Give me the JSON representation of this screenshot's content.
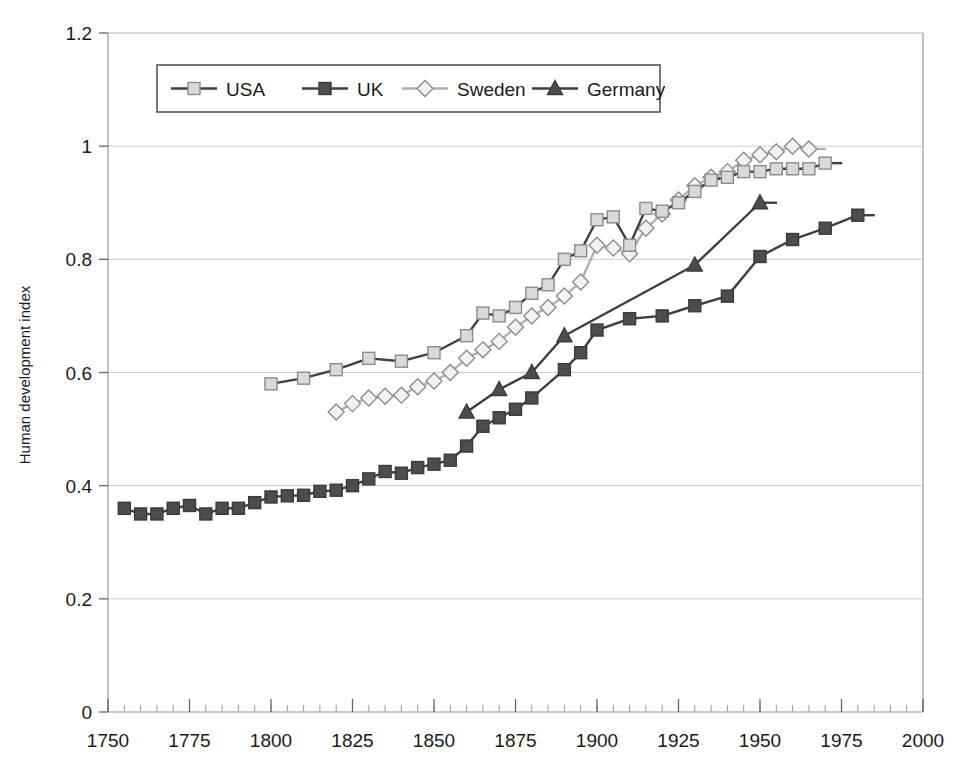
{
  "chart_data": {
    "type": "line",
    "title": "",
    "xlabel": "",
    "ylabel": "Human development index",
    "xlim": [
      1750,
      2000
    ],
    "ylim": [
      0,
      1.2
    ],
    "xticks": [
      1750,
      1775,
      1800,
      1825,
      1850,
      1875,
      1900,
      1925,
      1950,
      1975,
      2000
    ],
    "yticks": [
      0,
      0.2,
      0.4,
      0.6,
      0.8,
      1,
      1.2
    ],
    "xtick_labels": [
      "1750",
      "1775",
      "1800",
      "1825",
      "1850",
      "1875",
      "1900",
      "1925",
      "1950",
      "1975",
      "2000"
    ],
    "ytick_labels": [
      "0",
      "0.2",
      "0.4",
      "0.6",
      "0.8",
      "1",
      "1.2"
    ],
    "minor_tick_step": 5,
    "grid": "horizontal",
    "legend_position": "top-center",
    "series": [
      {
        "name": "USA",
        "marker": "square",
        "marker_fill": "#d9d9d9",
        "marker_stroke": "#8c8c8c",
        "line_color": "#3f3f3f",
        "points": [
          [
            1800,
            0.58
          ],
          [
            1810,
            0.59
          ],
          [
            1820,
            0.605
          ],
          [
            1830,
            0.625
          ],
          [
            1840,
            0.62
          ],
          [
            1850,
            0.635
          ],
          [
            1860,
            0.665
          ],
          [
            1865,
            0.705
          ],
          [
            1870,
            0.7
          ],
          [
            1875,
            0.715
          ],
          [
            1880,
            0.74
          ],
          [
            1885,
            0.755
          ],
          [
            1890,
            0.8
          ],
          [
            1895,
            0.815
          ],
          [
            1900,
            0.87
          ],
          [
            1905,
            0.875
          ],
          [
            1910,
            0.825
          ],
          [
            1915,
            0.89
          ],
          [
            1920,
            0.885
          ],
          [
            1925,
            0.9
          ],
          [
            1930,
            0.92
          ],
          [
            1935,
            0.94
          ],
          [
            1940,
            0.945
          ],
          [
            1945,
            0.955
          ],
          [
            1950,
            0.955
          ],
          [
            1955,
            0.96
          ],
          [
            1960,
            0.96
          ],
          [
            1965,
            0.96
          ],
          [
            1970,
            0.97
          ]
        ]
      },
      {
        "name": "UK",
        "marker": "square",
        "marker_fill": "#4d4d4d",
        "marker_stroke": "#3a3a3a",
        "line_color": "#3f3f3f",
        "points": [
          [
            1755,
            0.36
          ],
          [
            1760,
            0.35
          ],
          [
            1765,
            0.35
          ],
          [
            1770,
            0.36
          ],
          [
            1775,
            0.365
          ],
          [
            1780,
            0.35
          ],
          [
            1785,
            0.36
          ],
          [
            1790,
            0.36
          ],
          [
            1795,
            0.37
          ],
          [
            1800,
            0.38
          ],
          [
            1805,
            0.382
          ],
          [
            1810,
            0.383
          ],
          [
            1815,
            0.39
          ],
          [
            1820,
            0.392
          ],
          [
            1825,
            0.4
          ],
          [
            1830,
            0.412
          ],
          [
            1835,
            0.425
          ],
          [
            1840,
            0.422
          ],
          [
            1845,
            0.432
          ],
          [
            1850,
            0.438
          ],
          [
            1855,
            0.445
          ],
          [
            1860,
            0.47
          ],
          [
            1865,
            0.505
          ],
          [
            1870,
            0.52
          ],
          [
            1875,
            0.535
          ],
          [
            1880,
            0.555
          ],
          [
            1890,
            0.605
          ],
          [
            1895,
            0.635
          ],
          [
            1900,
            0.675
          ],
          [
            1910,
            0.695
          ],
          [
            1920,
            0.7
          ],
          [
            1930,
            0.718
          ],
          [
            1940,
            0.735
          ],
          [
            1950,
            0.805
          ],
          [
            1960,
            0.835
          ],
          [
            1970,
            0.855
          ],
          [
            1980,
            0.878
          ]
        ]
      },
      {
        "name": "Sweden",
        "marker": "diamond",
        "marker_fill": "#f2f2f2",
        "marker_stroke": "#8c8c8c",
        "line_color": "#b0b0b0",
        "points": [
          [
            1820,
            0.53
          ],
          [
            1825,
            0.545
          ],
          [
            1830,
            0.555
          ],
          [
            1835,
            0.558
          ],
          [
            1840,
            0.56
          ],
          [
            1845,
            0.575
          ],
          [
            1850,
            0.585
          ],
          [
            1855,
            0.6
          ],
          [
            1860,
            0.625
          ],
          [
            1865,
            0.64
          ],
          [
            1870,
            0.655
          ],
          [
            1875,
            0.68
          ],
          [
            1880,
            0.7
          ],
          [
            1885,
            0.715
          ],
          [
            1890,
            0.735
          ],
          [
            1895,
            0.76
          ],
          [
            1900,
            0.825
          ],
          [
            1905,
            0.82
          ],
          [
            1910,
            0.81
          ],
          [
            1915,
            0.855
          ],
          [
            1920,
            0.88
          ],
          [
            1925,
            0.905
          ],
          [
            1930,
            0.93
          ],
          [
            1935,
            0.945
          ],
          [
            1940,
            0.955
          ],
          [
            1945,
            0.975
          ],
          [
            1950,
            0.985
          ],
          [
            1955,
            0.99
          ],
          [
            1960,
            1.0
          ],
          [
            1965,
            0.995
          ]
        ]
      },
      {
        "name": "Germany",
        "marker": "triangle",
        "marker_fill": "#4d4d4d",
        "marker_stroke": "#3a3a3a",
        "line_color": "#3f3f3f",
        "points": [
          [
            1860,
            0.53
          ],
          [
            1870,
            0.57
          ],
          [
            1880,
            0.6
          ],
          [
            1890,
            0.665
          ],
          [
            1930,
            0.79
          ],
          [
            1950,
            0.9
          ]
        ]
      }
    ]
  },
  "legend": {
    "items": [
      {
        "label": "USA"
      },
      {
        "label": "UK"
      },
      {
        "label": "Sweden"
      },
      {
        "label": "Germany"
      }
    ]
  },
  "colors": {
    "plot_border": "#aaaaaa",
    "gridline": "#cccccc",
    "axis_text": "#1a1a1a",
    "background": "#ffffff"
  }
}
